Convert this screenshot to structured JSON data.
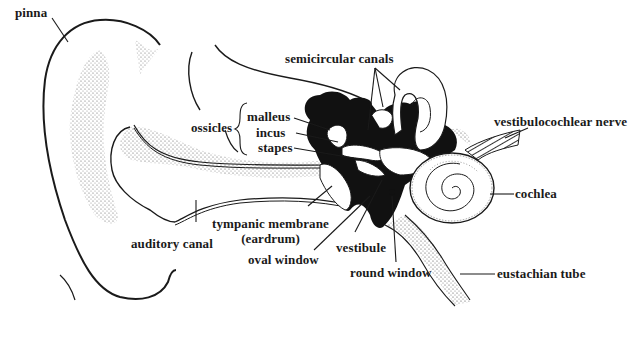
{
  "diagram": {
    "colors": {
      "ink": "#1a1a1a",
      "stipple": "#555555",
      "paper": "#ffffff"
    },
    "labels": {
      "pinna": "pinna",
      "semicircular_canals": "semicircular canals",
      "ossicles": "ossicles",
      "malleus": "malleus",
      "incus": "incus",
      "stapes": "stapes",
      "vestibulocochlear_nerve": "vestibulocochlear nerve",
      "cochlea": "cochlea",
      "tympanic_membrane": "tympanic membrane",
      "eardrum": "(eardrum)",
      "auditory_canal": "auditory canal",
      "oval_window": "oval window",
      "vestibule": "vestibule",
      "round_window": "round window",
      "eustachian_tube": "eustachian tube"
    }
  }
}
